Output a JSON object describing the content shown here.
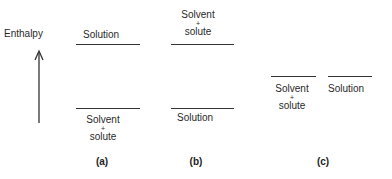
{
  "axis": {
    "label": "Enthalpy",
    "arrow": "up-arrow"
  },
  "panels": [
    {
      "id": "a",
      "caption": "(a)",
      "upper": {
        "label": "Solution"
      },
      "lower": {
        "line1": "Solvent",
        "plus": "+",
        "line2": "solute"
      }
    },
    {
      "id": "b",
      "caption": "(b)",
      "upper": {
        "line1": "Solvent",
        "plus": "+",
        "line2": "solute"
      },
      "lower": {
        "label": "Solution"
      }
    },
    {
      "id": "c",
      "caption": "(c)",
      "left": {
        "line1": "Solvent",
        "plus": "+",
        "line2": "solute"
      },
      "right": {
        "label": "Solution"
      }
    }
  ],
  "colors": {
    "line": "#333333",
    "text": "#2a2a2a"
  }
}
